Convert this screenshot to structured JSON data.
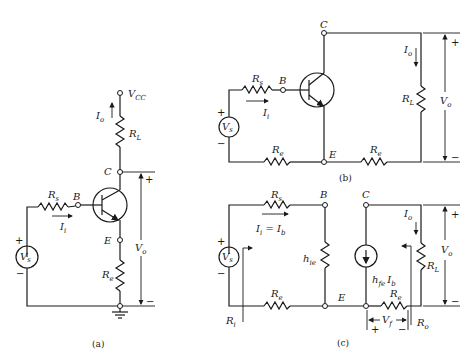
{
  "figure": {
    "panels": [
      {
        "id": "a",
        "caption": "(a)",
        "labels": {
          "vcc": "V",
          "vcc_sub": "CC",
          "io": "I",
          "io_sub": "o",
          "rl": "R",
          "rl_sub": "L",
          "c": "C",
          "b": "B",
          "e": "E",
          "rs": "R",
          "rs_sub": "s",
          "ii": "I",
          "ii_sub": "i",
          "vs": "V",
          "vs_sub": "s",
          "re": "R",
          "re_sub": "e",
          "vo": "V",
          "vo_sub": "o",
          "plus": "+",
          "minus": "−"
        }
      },
      {
        "id": "b",
        "caption": "(b)",
        "labels": {
          "c": "C",
          "b": "B",
          "e": "E",
          "rs": "R",
          "rs_sub": "s",
          "ii": "I",
          "ii_sub": "i",
          "vs": "V",
          "vs_sub": "s",
          "re_left": "R",
          "re_left_sub": "e",
          "re_right": "R",
          "re_right_sub": "e",
          "io": "I",
          "io_sub": "o",
          "rl": "R",
          "rl_sub": "L",
          "vo": "V",
          "vo_sub": "o",
          "plus": "+",
          "minus": "−"
        }
      },
      {
        "id": "c",
        "caption": "(c)",
        "labels": {
          "rs": "R",
          "rs_sub": "s",
          "b": "B",
          "c": "C",
          "ii_eq": "I",
          "ii_eq_sub": "i",
          "ii_eq_mid": " = I",
          "ii_eq_sub2": "b",
          "vs": "V",
          "vs_sub": "s",
          "hie": "h",
          "hie_sub": "ie",
          "hfe": "h",
          "hfe_sub": "fe",
          "hfe_ib": "I",
          "hfe_ib_sub": "b",
          "io": "I",
          "io_sub": "o",
          "rl": "R",
          "rl_sub": "L",
          "vo": "V",
          "vo_sub": "o",
          "re_left": "R",
          "re_left_sub": "e",
          "e": "E",
          "re_right": "R",
          "re_right_sub": "e",
          "ri": "R",
          "ri_sub": "i",
          "vf": "V",
          "vf_sub": "f",
          "ro": "R",
          "ro_sub": "o",
          "plus": "+",
          "minus": "−"
        }
      }
    ]
  }
}
